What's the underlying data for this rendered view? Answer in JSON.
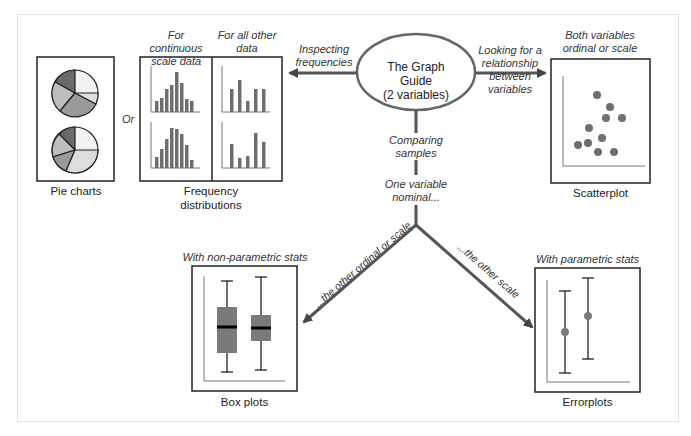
{
  "center": {
    "title": "The Graph Guide",
    "subtitle": "(2 variables)"
  },
  "edges": {
    "left": "Inspecting frequencies",
    "left_l1": "Inspecting",
    "left_l2": "frequencies",
    "right_l1": "Looking for a",
    "right_l2": "relationship",
    "right_l3": "between",
    "right_l4": "variables",
    "down_l1": "Comparing",
    "down_l2": "samples",
    "node_l1": "One variable",
    "node_l2": "nominal...",
    "branch_left": "...the other ordinal or scale",
    "branch_right": "...the other scale"
  },
  "or_label": "Or",
  "panels": {
    "pie": {
      "caption": "Pie charts"
    },
    "freq": {
      "caption_l1": "Frequency",
      "caption_l2": "distributions",
      "col1_l1": "For continuous",
      "col1_l2": "scale data",
      "col2_l1": "For all other",
      "col2_l2": "data"
    },
    "scatter": {
      "caption": "Scatterplot",
      "head_l1": "Both variables",
      "head_l2": "ordinal or scale"
    },
    "box": {
      "caption": "Box plots",
      "head": "With non-parametric stats"
    },
    "error": {
      "caption": "Errorplots",
      "head": "With parametric stats"
    }
  },
  "colors": {
    "line": "#555555",
    "bar": "#6e6e6e",
    "frame": "#222222"
  }
}
